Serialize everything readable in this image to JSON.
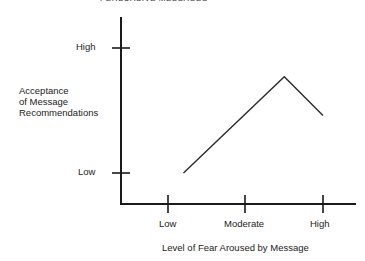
{
  "header": {
    "title": "PERSUASIVE MESSAGES"
  },
  "chart_data": {
    "type": "line",
    "title": "",
    "xlabel": "Level of Fear Aroused by Message",
    "ylabel": "Acceptance of Message Recommendations",
    "x_ticks": [
      "Low",
      "Moderate",
      "High"
    ],
    "y_ticks": [
      "Low",
      "High"
    ],
    "xlim": [
      0,
      2
    ],
    "ylim": [
      0,
      1
    ],
    "grid": false,
    "legend": null,
    "series": [
      {
        "name": "Acceptance",
        "x": [
          0.2,
          1.5,
          2.0
        ],
        "y": [
          0.0,
          0.77,
          0.46
        ]
      }
    ]
  },
  "labels": {
    "ylabel_lines": [
      "Acceptance",
      "of Message",
      "Recommendations"
    ],
    "y_high": "High",
    "y_low": "Low",
    "x_low": "Low",
    "x_moderate": "Moderate",
    "x_high": "High",
    "xlabel": "Level of Fear Aroused by Message"
  },
  "colors": {
    "line": "#2a2a2a",
    "axis": "#1a1a1a"
  }
}
